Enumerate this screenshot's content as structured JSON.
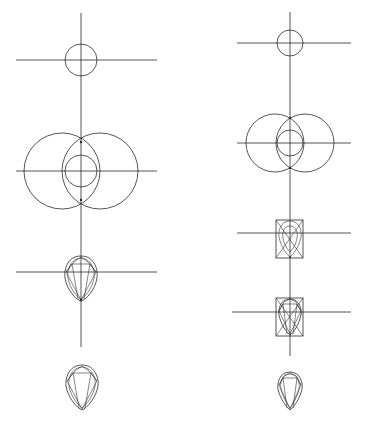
{
  "diagram": {
    "title": "",
    "stroke_color": "#2a2a2a",
    "background": "#ffffff",
    "columns": [
      {
        "name": "left-construction",
        "axis_x": 81,
        "vertical_axis": {
          "y1": 13,
          "y2": 347
        },
        "steps": [
          {
            "step": 1,
            "type": "circle-on-cross",
            "cx": 81,
            "cy": 60,
            "r": 16,
            "hline": {
              "x1": 16,
              "x2": 157
            }
          },
          {
            "step": 2,
            "type": "vesica-circles",
            "cy": 171,
            "small_r": 16,
            "big_r": 38,
            "big_centers_x": [
              62,
              100
            ],
            "hline": {
              "x1": 16,
              "x2": 157
            }
          },
          {
            "step": 3,
            "type": "pear-with-facets-on-cross",
            "cx": 81,
            "cy": 272,
            "hline": {
              "x1": 16,
              "x2": 157
            }
          },
          {
            "step": 4,
            "type": "pear-final",
            "cx": 81,
            "cy": 385
          }
        ]
      },
      {
        "name": "right-construction",
        "axis_x": 290,
        "vertical_axis": {
          "y1": 12,
          "y2": 356
        },
        "steps": [
          {
            "step": 1,
            "type": "circle-on-cross",
            "cx": 290,
            "cy": 43,
            "r": 13,
            "hline": {
              "x1": 237,
              "x2": 351
            }
          },
          {
            "step": 2,
            "type": "vesica-circles",
            "cy": 143,
            "small_r": 13,
            "big_r": 29,
            "big_centers_x": [
              275,
              305
            ],
            "hline": {
              "x1": 237,
              "x2": 351
            }
          },
          {
            "step": 3,
            "type": "boxed-pear-construction",
            "box": {
              "x": 276,
              "y": 220,
              "w": 27,
              "h": 38
            },
            "hline_y": 233,
            "hline": {
              "x1": 237,
              "x2": 351
            }
          },
          {
            "step": 4,
            "type": "boxed-pear-facets",
            "box": {
              "x": 276,
              "y": 298,
              "w": 27,
              "h": 38
            },
            "hline_y": 312,
            "hline": {
              "x1": 232,
              "x2": 351
            }
          },
          {
            "step": 5,
            "type": "pear-final",
            "cx": 290,
            "cy": 392
          }
        ]
      }
    ]
  }
}
